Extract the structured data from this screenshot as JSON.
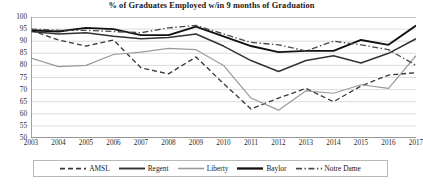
{
  "chart_data": {
    "type": "line",
    "title": "% of Graduates Employed w/in 9 months of Graduation",
    "xlabel": "",
    "ylabel": "",
    "ylim": [
      50,
      100
    ],
    "ytick_step": 5,
    "yticks": [
      100,
      95,
      90,
      85,
      80,
      75,
      70,
      65,
      60,
      55,
      50
    ],
    "grid": true,
    "legend_position": "bottom",
    "categories": [
      "2003",
      "2004",
      "2005",
      "2006",
      "2007",
      "2008",
      "2009",
      "2010",
      "2011",
      "2012",
      "2013",
      "2014",
      "2015",
      "2016",
      "2017"
    ],
    "series": [
      {
        "name": "AMSL",
        "style": "dashed",
        "color": "#3a3a3a",
        "values": [
          94.5,
          90.5,
          88.0,
          90.5,
          79.0,
          76.5,
          83.5,
          72.5,
          62.0,
          66.5,
          70.5,
          65.0,
          71.5,
          76.0,
          77.0
        ]
      },
      {
        "name": "Regent",
        "style": "solid",
        "color": "#333333",
        "values": [
          94.0,
          93.0,
          93.5,
          92.0,
          91.0,
          91.5,
          93.0,
          88.0,
          82.0,
          77.5,
          82.0,
          84.0,
          81.0,
          85.0,
          91.0
        ]
      },
      {
        "name": "Liberty",
        "style": "solid",
        "color": "#9a9a9a",
        "values": [
          83.0,
          79.5,
          80.0,
          84.5,
          85.5,
          87.0,
          86.5,
          80.0,
          66.5,
          61.5,
          69.5,
          68.5,
          72.0,
          70.5,
          84.0
        ]
      },
      {
        "name": "Baylor",
        "style": "solid",
        "color": "#111111",
        "values": [
          94.5,
          94.0,
          95.5,
          95.0,
          92.5,
          92.5,
          96.0,
          92.0,
          88.0,
          85.5,
          86.0,
          86.0,
          90.5,
          88.5,
          96.5
        ]
      },
      {
        "name": "Notre Dame",
        "style": "dashdot",
        "color": "#4a4a4a",
        "values": [
          95.0,
          94.5,
          94.5,
          94.0,
          93.5,
          95.5,
          96.5,
          93.0,
          89.5,
          88.5,
          86.0,
          90.0,
          88.5,
          86.5,
          80.0
        ]
      }
    ]
  }
}
